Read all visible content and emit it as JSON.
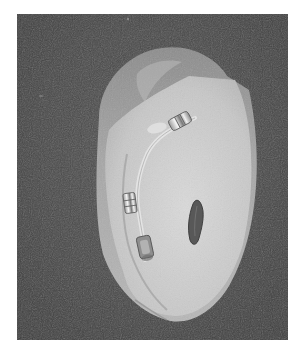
{
  "image": {
    "description": "Grayscale photograph of a translucent ear-shaped silicone prosthesis with embedded electrode contacts and wire, resting on a dark textured background",
    "colors": {
      "page_background": "#ffffff",
      "backdrop": "#4a4a4a",
      "backdrop_dark": "#3a3a3a",
      "outer_shell": "#9a9a9a",
      "outer_shell_light": "#b4b4b4",
      "inner_layer": "#c9c9c9",
      "inner_layer_light": "#dcdcdc",
      "contact_metal": "#f2f2f2",
      "contact_shadow": "#6a6a6a",
      "opening": "#5a5a5a"
    }
  }
}
